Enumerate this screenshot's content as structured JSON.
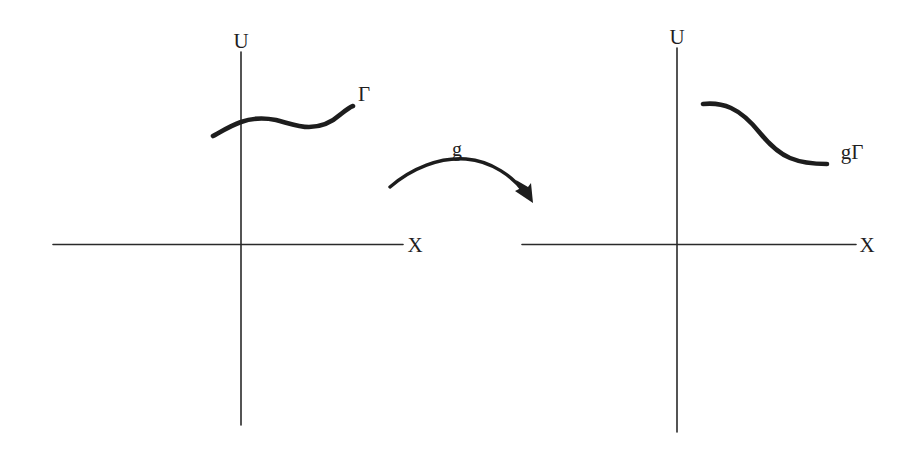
{
  "figure": {
    "background_color": "#ffffff",
    "ink_color": "#1d1d1d"
  },
  "left_panel": {
    "name": "source-plane",
    "vertical_axis_label": "U",
    "horizontal_axis_label": "X",
    "curve_label": "Γ",
    "axes": {
      "origin_x": 241,
      "origin_y": 244,
      "vertical_top_y": 52,
      "vertical_bottom_y": 425,
      "horizontal_left_x": 53,
      "horizontal_right_x": 403
    },
    "curve_points": [
      [
        213,
        136
      ],
      [
        228,
        128
      ],
      [
        241,
        122
      ],
      [
        258,
        119
      ],
      [
        275,
        120
      ],
      [
        292,
        124
      ],
      [
        308,
        127
      ],
      [
        322,
        126
      ],
      [
        336,
        118
      ],
      [
        347,
        110
      ],
      [
        353,
        106
      ]
    ]
  },
  "right_panel": {
    "name": "image-plane",
    "vertical_axis_label": "U",
    "horizontal_axis_label": "X",
    "curve_label": "gΓ",
    "axes": {
      "origin_x": 677,
      "origin_y": 244,
      "vertical_top_y": 48,
      "vertical_bottom_y": 432,
      "horizontal_left_x": 522,
      "horizontal_right_x": 856
    },
    "curve_points": [
      [
        703,
        104
      ],
      [
        718,
        104
      ],
      [
        733,
        108
      ],
      [
        748,
        117
      ],
      [
        760,
        128
      ],
      [
        772,
        140
      ],
      [
        786,
        151
      ],
      [
        802,
        159
      ],
      [
        816,
        163
      ],
      [
        827,
        164
      ]
    ]
  },
  "map_arrow": {
    "name": "g-map-arrow",
    "label": "g",
    "label_x": 457,
    "label_y": 156,
    "start": [
      390,
      187
    ],
    "control": [
      458,
      156
    ],
    "end": [
      526,
      196
    ],
    "arrowhead_tip": [
      532,
      202
    ]
  },
  "labels": {
    "left_u": {
      "text": "U",
      "x": 241,
      "y": 48
    },
    "left_x": {
      "text": "X",
      "x": 415,
      "y": 252
    },
    "left_gamma": {
      "text": "Γ",
      "x": 364,
      "y": 101
    },
    "right_u": {
      "text": "U",
      "x": 677,
      "y": 44
    },
    "right_x": {
      "text": "X",
      "x": 867,
      "y": 252
    },
    "right_ggamma": {
      "text": "gΓ",
      "x": 852,
      "y": 159
    }
  }
}
